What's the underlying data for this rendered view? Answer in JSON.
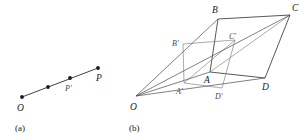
{
  "figure": {
    "width": 308,
    "height": 140,
    "background": "#ffffff",
    "ink": "#2b2b2b",
    "ink_light": "#7d7d7d"
  },
  "panels": [
    {
      "id": "panel-a",
      "caption": "(a)",
      "caption_pos": {
        "x": 15,
        "y": 131
      },
      "description": "collinear points on a ray from O",
      "points": [
        {
          "name": "O",
          "label": "O",
          "x": 22,
          "y": 97,
          "lx": 17,
          "ly": 111,
          "dot": true,
          "labeled": true,
          "style": "major"
        },
        {
          "name": "Q",
          "label": "",
          "x": 48,
          "y": 87,
          "lx": 0,
          "ly": 0,
          "dot": true,
          "labeled": false,
          "style": "major"
        },
        {
          "name": "Pp",
          "label": "P'",
          "x": 70,
          "y": 78,
          "lx": 65,
          "ly": 91,
          "dot": true,
          "labeled": true,
          "style": "minor"
        },
        {
          "name": "P",
          "label": "P",
          "x": 98,
          "y": 68,
          "lx": 96,
          "ly": 81,
          "dot": true,
          "labeled": true,
          "style": "major"
        }
      ],
      "segments": [
        {
          "name": "ray-O-P",
          "from": "O",
          "to": "P",
          "style": "seg-main"
        }
      ]
    },
    {
      "id": "panel-b",
      "caption": "(b)",
      "caption_pos": {
        "x": 129,
        "y": 131
      },
      "description": "central projection of parallelogram A'B'C'D' onto ABCD from centre O",
      "points": [
        {
          "name": "O",
          "label": "O",
          "x": 136,
          "y": 96,
          "lx": 130,
          "ly": 110,
          "dot": false,
          "labeled": true,
          "style": "major"
        },
        {
          "name": "A",
          "label": "A",
          "x": 210,
          "y": 72,
          "lx": 204,
          "ly": 83,
          "dot": false,
          "labeled": true,
          "style": "major"
        },
        {
          "name": "B",
          "label": "B",
          "x": 218,
          "y": 19,
          "lx": 212,
          "ly": 13,
          "dot": false,
          "labeled": true,
          "style": "major"
        },
        {
          "name": "C",
          "label": "C",
          "x": 290,
          "y": 15,
          "lx": 292,
          "ly": 11,
          "dot": false,
          "labeled": true,
          "style": "major"
        },
        {
          "name": "D",
          "label": "D",
          "x": 265,
          "y": 78,
          "lx": 262,
          "ly": 90,
          "dot": false,
          "labeled": true,
          "style": "major"
        },
        {
          "name": "Ap",
          "label": "A'",
          "x": 184,
          "y": 83,
          "lx": 176,
          "ly": 94,
          "dot": false,
          "labeled": true,
          "style": "minor"
        },
        {
          "name": "Bp",
          "label": "B'",
          "x": 183,
          "y": 44,
          "lx": 172,
          "ly": 46,
          "dot": false,
          "labeled": true,
          "style": "minor"
        },
        {
          "name": "Cp",
          "label": "C'",
          "x": 235,
          "y": 40,
          "lx": 229,
          "ly": 39,
          "dot": false,
          "labeled": true,
          "style": "minor"
        },
        {
          "name": "Dp",
          "label": "D'",
          "x": 222,
          "y": 88,
          "lx": 215,
          "ly": 99,
          "dot": false,
          "labeled": true,
          "style": "minor"
        }
      ],
      "segments": [
        {
          "name": "outer-AB",
          "from": "A",
          "to": "B",
          "style": "seg-outer"
        },
        {
          "name": "outer-BC",
          "from": "B",
          "to": "C",
          "style": "seg-outer"
        },
        {
          "name": "outer-CD",
          "from": "C",
          "to": "D",
          "style": "seg-outer"
        },
        {
          "name": "outer-DA",
          "from": "D",
          "to": "A",
          "style": "seg-outer"
        },
        {
          "name": "diag-AC",
          "from": "A",
          "to": "C",
          "style": "seg-inner"
        },
        {
          "name": "inner-ApBp",
          "from": "Ap",
          "to": "Bp",
          "style": "seg-inner"
        },
        {
          "name": "inner-BpCp",
          "from": "Bp",
          "to": "Cp",
          "style": "seg-inner"
        },
        {
          "name": "inner-CpDp",
          "from": "Cp",
          "to": "Dp",
          "style": "seg-inner"
        },
        {
          "name": "inner-DpAp",
          "from": "Dp",
          "to": "Ap",
          "style": "seg-inner"
        },
        {
          "name": "diag-ApCp",
          "from": "Ap",
          "to": "Cp",
          "style": "seg-inner"
        },
        {
          "name": "ray-O-A",
          "from": "O",
          "to": "A",
          "style": "seg-ray"
        },
        {
          "name": "ray-O-B",
          "from": "O",
          "to": "B",
          "style": "seg-ray"
        },
        {
          "name": "ray-O-C",
          "from": "O",
          "to": "C",
          "style": "seg-ray"
        },
        {
          "name": "ray-O-D",
          "from": "O",
          "to": "D",
          "style": "seg-ray"
        }
      ]
    }
  ]
}
